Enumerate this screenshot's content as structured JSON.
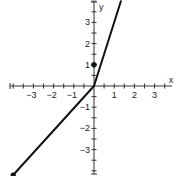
{
  "chart_data": {
    "type": "line",
    "title": "",
    "xlabel": "x",
    "ylabel": "y",
    "xlim": [
      -4,
      4
    ],
    "ylim": [
      -4.2,
      4
    ],
    "grid": false,
    "x_ticks": [
      -3,
      -2,
      -1,
      1,
      2,
      3
    ],
    "y_ticks": [
      -3,
      -2,
      -1,
      1,
      2,
      3
    ],
    "x_tick_labels": [
      "−3",
      "−2",
      "−1",
      "1",
      "2",
      "3"
    ],
    "y_tick_labels": [
      "−3",
      "−2",
      "−1",
      "1",
      "2",
      "3"
    ],
    "series": [
      {
        "name": "left piece",
        "points": [
          [
            -4,
            -4.2
          ],
          [
            0,
            0
          ]
        ],
        "start_marker": "closed",
        "end_marker": "none"
      },
      {
        "name": "right piece",
        "points": [
          [
            0,
            0
          ],
          [
            1.33,
            4
          ]
        ],
        "start_marker": "none",
        "end_marker": "arrow-continues"
      }
    ],
    "points": [
      {
        "x": 0,
        "y": 1,
        "marker": "closed"
      }
    ],
    "colors": {
      "line": "#111111",
      "axis": "#333333"
    }
  }
}
